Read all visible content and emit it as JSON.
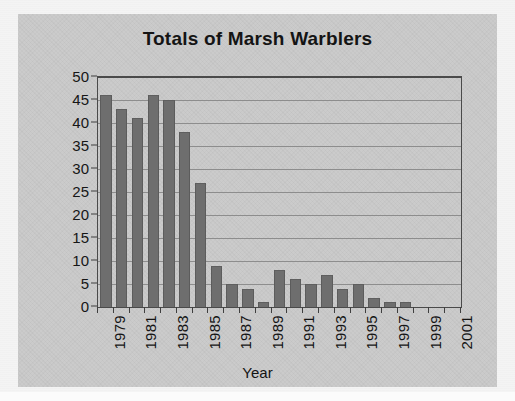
{
  "chart_data": {
    "type": "bar",
    "title": "Totals of Marsh Warblers",
    "xlabel": "Year",
    "ylabel": "Pairs + singing males",
    "categories": [
      "1979",
      "1980",
      "1981",
      "1982",
      "1983",
      "1984",
      "1985",
      "1986",
      "1987",
      "1988",
      "1989",
      "1990",
      "1991",
      "1992",
      "1993",
      "1994",
      "1995",
      "1996",
      "1997",
      "1998",
      "1999",
      "2000",
      "2001"
    ],
    "values": [
      46,
      43,
      41,
      46,
      45,
      38,
      27,
      9,
      5,
      4,
      1,
      8,
      6,
      5,
      7,
      4,
      5,
      2,
      1,
      1,
      0,
      0,
      0
    ],
    "ylim": [
      0,
      50
    ],
    "ytick_step": 5,
    "ytick_labels": [
      "0",
      "5",
      "10",
      "15",
      "20",
      "25",
      "30",
      "35",
      "40",
      "45",
      "50"
    ],
    "xtick_labels_shown": [
      "1979",
      "1981",
      "1983",
      "1985",
      "1987",
      "1989",
      "1991",
      "1993",
      "1995",
      "1997",
      "1999",
      "2001"
    ],
    "grid": "horizontal",
    "legend": "none",
    "bar_color": "#6e6e6e",
    "plot_border_color": "#4a4a4a",
    "gridline_color": "#8d8d8d",
    "background_color": "#c9c9c9",
    "text_color": "#141414"
  }
}
